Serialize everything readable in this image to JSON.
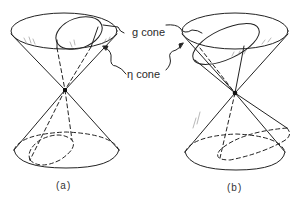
{
  "figure": {
    "panels": [
      {
        "id": "a",
        "caption": "(a)"
      },
      {
        "id": "b",
        "caption": "(b)"
      }
    ],
    "labels": {
      "g_cone": "g  cone",
      "eta_cone": "η  cone"
    },
    "colors": {
      "ink": "#222222",
      "background": "#ffffff"
    }
  }
}
